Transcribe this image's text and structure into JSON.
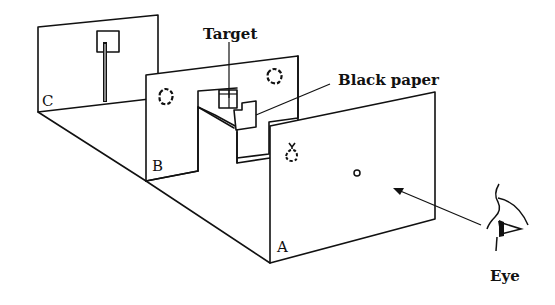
{
  "diagram": {
    "labels": {
      "target": "Target",
      "black_paper": "Black paper",
      "eye": "Eye",
      "panel_a": "A",
      "panel_b": "B",
      "panel_c": "C"
    },
    "colors": {
      "ink": "#111111",
      "paper": "#ffffff"
    }
  }
}
